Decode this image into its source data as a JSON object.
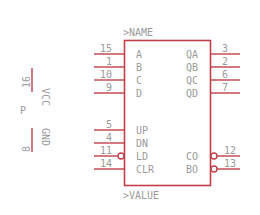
{
  "symbol": {
    "name_label": ">NAME",
    "value_label": ">VALUE",
    "colors": {
      "outline": "#c0404a",
      "text": "#9a9a9a",
      "background": "#ffffff"
    },
    "left_pins": [
      {
        "num": "15",
        "name": "A",
        "inverted": false
      },
      {
        "num": "1",
        "name": "B",
        "inverted": false
      },
      {
        "num": "10",
        "name": "C",
        "inverted": false
      },
      {
        "num": "9",
        "name": "D",
        "inverted": false
      },
      {
        "num": "5",
        "name": "UP",
        "inverted": false
      },
      {
        "num": "4",
        "name": "DN",
        "inverted": false
      },
      {
        "num": "11",
        "name": "LD",
        "inverted": true
      },
      {
        "num": "14",
        "name": "CLR",
        "inverted": false
      }
    ],
    "right_pins": [
      {
        "num": "3",
        "name": "QA",
        "inverted": false
      },
      {
        "num": "2",
        "name": "QB",
        "inverted": false
      },
      {
        "num": "6",
        "name": "QC",
        "inverted": false
      },
      {
        "num": "7",
        "name": "QD",
        "inverted": false
      },
      {
        "num": "12",
        "name": "CO",
        "inverted": true
      },
      {
        "num": "13",
        "name": "BO",
        "inverted": true
      }
    ]
  },
  "power": {
    "part_label": "P",
    "vcc": {
      "num": "16",
      "name": "VCC"
    },
    "gnd": {
      "num": "8",
      "name": "GND"
    }
  }
}
